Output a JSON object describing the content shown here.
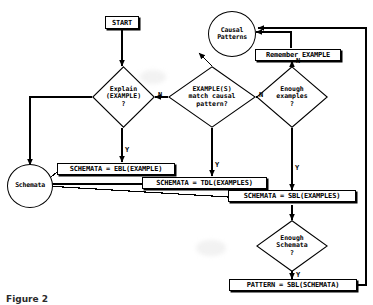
{
  "figure": {
    "type": "flowchart",
    "caption": "Figure 2"
  },
  "nodes": {
    "start": {
      "label": "START",
      "shape": "box"
    },
    "causal_patterns": {
      "label": "Causal\nPatterns",
      "shape": "circle"
    },
    "remember_example": {
      "label": "Remember EXAMPLE",
      "shape": "box"
    },
    "explain": {
      "label": "Explain\n(EXAMPLE)\n?",
      "shape": "diamond"
    },
    "match_pattern": {
      "label": "EXAMPLE(S)\nmatch causal\npattern?",
      "shape": "diamond"
    },
    "enough_examples": {
      "label": "Enough\nexamples\n?",
      "shape": "diamond"
    },
    "schemata": {
      "label": "Schemata",
      "shape": "circle"
    },
    "ebl": {
      "label": "SCHEMATA = EBL(EXAMPLE)",
      "shape": "box"
    },
    "tdl": {
      "label": "SCHEMATA = TDL(EXAMPLES)",
      "shape": "box"
    },
    "sbl_examples": {
      "label": "SCHEMATA = SBL(EXAMPLES)",
      "shape": "box"
    },
    "enough_schemata": {
      "label": "Enough\nSchemata\n?",
      "shape": "diamond"
    },
    "pattern_sbl": {
      "label": "PATTERN = SBL(SCHEMATA)",
      "shape": "box"
    }
  },
  "edge_labels": {
    "explain_no": "N",
    "explain_yes": "Y",
    "match_no": "N",
    "match_yes": "Y",
    "enough_examples_no": "N",
    "enough_examples_yes": "Y",
    "enough_schemata_yes": "Y"
  },
  "colors": {
    "line": "#000000",
    "fill": "#ffffff",
    "text": "#000000"
  }
}
